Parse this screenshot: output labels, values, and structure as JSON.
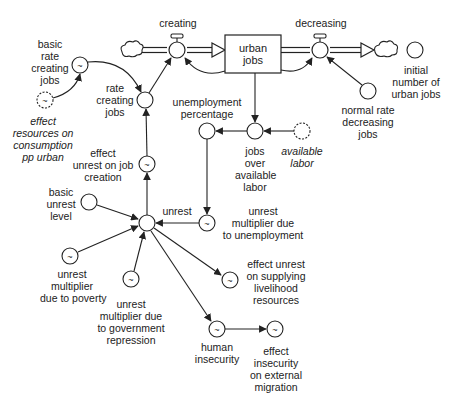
{
  "diagram": {
    "type": "stock-and-flow",
    "stock": {
      "id": "urban_jobs",
      "label": "urban\njobs"
    },
    "flows": [
      {
        "id": "creating",
        "label": "creating",
        "direction": "into urban jobs"
      },
      {
        "id": "decreasing",
        "label": "decreasing",
        "direction": "out of urban jobs"
      }
    ],
    "variables": {
      "basic_rate_creating_jobs": "basic\nrate\ncreating\njobs",
      "effect_resources": "effect\nresources on\nconsumption\npp urban",
      "rate_creating_jobs": "rate\ncreating\njobs",
      "unemployment_percentage": "unemployment\npercentage",
      "jobs_over_available_labor": "jobs\nover\navailable\nlabor",
      "available_labor": "available\nlabor",
      "normal_rate_decreasing_jobs": "normal rate\ndecreasing\njobs",
      "initial_number_urban_jobs": "initial\nnumber of\nurban jobs",
      "effect_unrest_job_creation": "effect\nunrest on job\ncreation",
      "basic_unrest_level": "basic\nunrest\nlevel",
      "unrest": "unrest",
      "unrest_multiplier_unemployment": "unrest\nmultiplier due\nto unemployment",
      "unrest_multiplier_poverty": "unrest\nmultiplier\ndue to poverty",
      "unrest_multiplier_repression": "unrest\nmultiplier due\nto government\nrepression",
      "effect_unrest_supplying": "effect unrest\non supplying\nlivelihood\nresources",
      "human_insecurity": "human\ninsecurity",
      "effect_insecurity_migration": "effect\ninsecurity\non external\nmigration"
    },
    "links": [
      [
        "effect resources on consumption pp urban",
        "basic rate creating jobs"
      ],
      [
        "basic rate creating jobs",
        "rate creating jobs"
      ],
      [
        "rate creating jobs",
        "creating"
      ],
      [
        "urban jobs",
        "creating"
      ],
      [
        "urban jobs",
        "decreasing"
      ],
      [
        "normal rate decreasing jobs",
        "decreasing"
      ],
      [
        "urban jobs",
        "jobs over available labor"
      ],
      [
        "available labor",
        "jobs over available labor"
      ],
      [
        "jobs over available labor",
        "unemployment percentage"
      ],
      [
        "unemployment percentage",
        "unrest multiplier due to unemployment"
      ],
      [
        "unrest multiplier due to unemployment",
        "unrest"
      ],
      [
        "basic unrest level",
        "unrest"
      ],
      [
        "unrest multiplier due to poverty",
        "unrest"
      ],
      [
        "unrest multiplier due to government repression",
        "unrest"
      ],
      [
        "unrest",
        "effect unrest on job creation"
      ],
      [
        "effect unrest on job creation",
        "rate creating jobs"
      ],
      [
        "unrest",
        "effect unrest on supplying livelihood resources"
      ],
      [
        "unrest",
        "human insecurity"
      ],
      [
        "human insecurity",
        "effect insecurity on external migration"
      ]
    ],
    "colors": {
      "line": "#222222",
      "background": "#ffffff"
    }
  }
}
